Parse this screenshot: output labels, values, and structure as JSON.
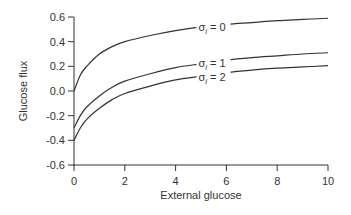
{
  "chart_data": {
    "type": "line",
    "title": "",
    "xlabel": "External glucose",
    "ylabel": "Glucose flux",
    "xlim": [
      0,
      10
    ],
    "ylim": [
      -0.6,
      0.6
    ],
    "xticks": [
      "0",
      "2",
      "4",
      "6",
      "8",
      "10"
    ],
    "yticks": [
      "0.6",
      "0.4",
      "0.2",
      "0.0",
      "-0.2",
      "-0.4",
      "-0.6"
    ],
    "grid": false,
    "legend": "inline annotations",
    "x": [
      0,
      0.25,
      0.5,
      1,
      1.5,
      2,
      3,
      4,
      5,
      6,
      7,
      8,
      9,
      10
    ],
    "series": [
      {
        "name": "σi = 0",
        "values": [
          0.0,
          0.13,
          0.2,
          0.3,
          0.36,
          0.4,
          0.45,
          0.49,
          0.52,
          0.54,
          0.555,
          0.57,
          0.58,
          0.59
        ]
      },
      {
        "name": "σi = 1",
        "values": [
          -0.3,
          -0.2,
          -0.13,
          -0.04,
          0.03,
          0.08,
          0.14,
          0.19,
          0.22,
          0.25,
          0.27,
          0.285,
          0.3,
          0.31
        ]
      },
      {
        "name": "σi = 2",
        "values": [
          -0.4,
          -0.3,
          -0.23,
          -0.14,
          -0.07,
          -0.02,
          0.04,
          0.09,
          0.12,
          0.15,
          0.17,
          0.185,
          0.195,
          0.205
        ]
      }
    ],
    "annotations": [
      {
        "label": "σi = 0",
        "x": 4.9,
        "y": 0.52
      },
      {
        "label": "σi = 1",
        "x": 4.9,
        "y": 0.23
      },
      {
        "label": "σi = 2",
        "x": 4.9,
        "y": 0.11
      }
    ]
  }
}
